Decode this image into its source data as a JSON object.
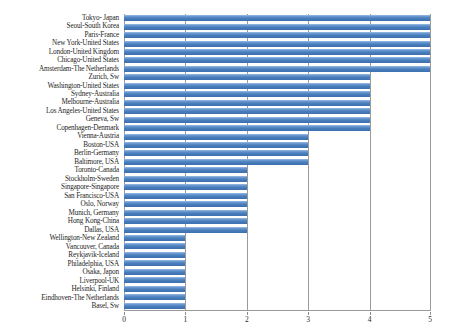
{
  "chart_data": {
    "type": "bar",
    "orientation": "horizontal",
    "title": "",
    "xlabel": "",
    "ylabel": "",
    "xlim": [
      0,
      5
    ],
    "xticks": [
      0,
      1,
      2,
      3,
      4,
      5
    ],
    "xtick_labels": [
      "0",
      "1",
      "2",
      "3",
      "4",
      "5"
    ],
    "grid": true,
    "legend": false,
    "bar_color": "#4a7ebb",
    "axis_color": "#9a9a9a",
    "categories": [
      "Tokyo- Japan",
      "Seoul-South Korea",
      "Paris-France",
      "New York-United States",
      "London-United Kingdom",
      "Chicago-United States",
      "Amsterdam-The Netherlands",
      "Zurich, Sw",
      "Washington-United States",
      "Sydney-Australia",
      "Melbourne-Australia",
      "Los Angeles-United States",
      "Geneva, Sw",
      "Copenhagen-Denmark",
      "Vienna-Austria",
      "Boston-USA",
      "Berlin-Germany",
      "Baltimore, USA",
      "Toronto-Canada",
      "Stockholm-Sweden",
      "Singapore-Singapore",
      "San Francisco-USA",
      "Oslo, Norway",
      "Munich, Germany",
      "Hong Kong-China",
      "Dallas, USA",
      "Wellington-New Zealand",
      "Vancouver, Canada",
      "Reykjavik-Iceland",
      "Philadelphia, USA",
      "Osaka, Japon",
      "Liverpool-UK",
      "Helsinki, Finland",
      "Eindhoven-The Netherlands",
      "Basel, Sw"
    ],
    "values": [
      5,
      5,
      5,
      5,
      5,
      5,
      5,
      4,
      4,
      4,
      4,
      4,
      4,
      4,
      3,
      3,
      3,
      3,
      2,
      2,
      2,
      2,
      2,
      2,
      2,
      2,
      1,
      1,
      1,
      1,
      1,
      1,
      1,
      1,
      1
    ]
  }
}
